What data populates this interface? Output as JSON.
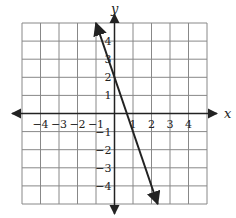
{
  "chart_data": {
    "type": "line",
    "title": "",
    "xlabel": "x",
    "ylabel": "y",
    "xlim": [
      -5,
      5
    ],
    "ylim": [
      -5,
      5
    ],
    "grid": true,
    "x_ticks": [
      -4,
      -3,
      -2,
      -1,
      1,
      2,
      3,
      4
    ],
    "y_ticks": [
      -4,
      -3,
      -2,
      -1,
      1,
      2,
      3,
      4
    ],
    "x_tick_labels": [
      "−4",
      "−3",
      "−2",
      "−1",
      "1",
      "2",
      "3",
      "4"
    ],
    "y_tick_labels": [
      "−4",
      "−3",
      "−2",
      "−1",
      "1",
      "2",
      "3",
      "4"
    ],
    "series": [
      {
        "name": "line",
        "equation": "y = -3x + 2",
        "slope": -3,
        "y_intercept": 2,
        "x": [
          -1,
          2.333
        ],
        "y": [
          5,
          -5
        ],
        "arrows_both_ends": true
      }
    ],
    "colors": {
      "grid": "#888888",
      "axes": "#222222",
      "line": "#222222"
    }
  },
  "axes": {
    "x_label": "x",
    "y_label": "y"
  }
}
